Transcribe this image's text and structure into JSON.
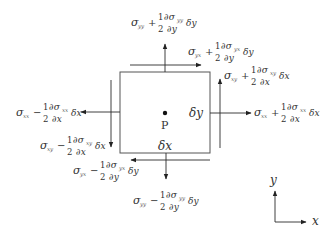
{
  "diagram": {
    "point_label": "P",
    "width_label": "δx",
    "height_label": "δy",
    "axis_x_label": "x",
    "axis_y_label": "y"
  },
  "labels": [
    {
      "id": "top-normal",
      "sigma": "σ",
      "sub": "yy",
      "op": "+",
      "num": "1",
      "den": "2",
      "dnum": "∂σ",
      "dsub": "yy",
      "dden": "∂y",
      "delta": "δy"
    },
    {
      "id": "top-shear",
      "sigma": "σ",
      "sub": "yx",
      "op": "+",
      "num": "1",
      "den": "2",
      "dnum": "∂σ",
      "dsub": "yx",
      "dden": "∂y",
      "delta": "δy"
    },
    {
      "id": "right-shear",
      "sigma": "σ",
      "sub": "xy",
      "op": "+",
      "num": "1",
      "den": "2",
      "dnum": "∂σ",
      "dsub": "xy",
      "dden": "∂x",
      "delta": "δx"
    },
    {
      "id": "right-normal",
      "sigma": "σ",
      "sub": "xx",
      "op": "+",
      "num": "1",
      "den": "2",
      "dnum": "∂σ",
      "dsub": "xx",
      "dden": "∂x",
      "delta": "δx"
    },
    {
      "id": "left-normal",
      "sigma": "σ",
      "sub": "xx",
      "op": "−",
      "num": "1",
      "den": "2",
      "dnum": "∂σ",
      "dsub": "xx",
      "dden": "∂x",
      "delta": "δx"
    },
    {
      "id": "left-shear",
      "sigma": "σ",
      "sub": "xy",
      "op": "−",
      "num": "1",
      "den": "2",
      "dnum": "∂σ",
      "dsub": "xy",
      "dden": "∂x",
      "delta": "δx"
    },
    {
      "id": "bottom-shear",
      "sigma": "σ",
      "sub": "yx",
      "op": "−",
      "num": "1",
      "den": "2",
      "dnum": "∂σ",
      "dsub": "yx",
      "dden": "∂y",
      "delta": "δy"
    },
    {
      "id": "bottom-normal",
      "sigma": "σ",
      "sub": "yy",
      "op": "−",
      "num": "1",
      "den": "2",
      "dnum": "∂σ",
      "dsub": "yy",
      "dden": "∂y",
      "delta": "δy"
    }
  ],
  "colors": {
    "line": "#2a2a2a",
    "text": "#333333",
    "background": "#ffffff"
  }
}
